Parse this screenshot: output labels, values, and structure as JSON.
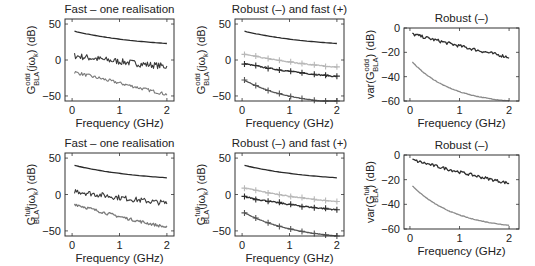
{
  "chart_data": [
    {
      "id": "p1",
      "type": "line",
      "title": "Fast – one realisation",
      "xlabel": "Frequency (GHz)",
      "ylabel_main": "G",
      "ylabel_sup": "odd",
      "ylabel_sub": "BLA",
      "ylabel_tail": "(jω",
      "ylabel_tail_sub": "k",
      "ylabel_end": ") (dB)",
      "xlim": [
        -0.15,
        2.15
      ],
      "ylim": [
        -57,
        57
      ],
      "xticks": [
        0,
        1,
        2
      ],
      "yticks": [
        50,
        0,
        -50
      ],
      "box": [
        65,
        19,
        174,
        101
      ],
      "series": [
        {
          "name": "BLA",
          "color": "#2a2a2a",
          "start": 40,
          "end": 23,
          "curve": 0.6,
          "noise": 0,
          "markers": false
        },
        {
          "name": "Total distortion",
          "color": "#3a3a3a",
          "start": 6,
          "end": -9,
          "curve": 0.2,
          "noise": 4.5,
          "markers": false
        },
        {
          "name": "Noise",
          "color": "#7a7a7a",
          "start": -17,
          "end": -48,
          "curve": 0,
          "noise": 2.2,
          "markers": false
        }
      ]
    },
    {
      "id": "p2",
      "type": "line",
      "title": "Robust (–) and fast (+)",
      "xlabel": "Frequency (GHz)",
      "ylabel_main": "G",
      "ylabel_sup": "odd",
      "ylabel_sub": "BLA",
      "ylabel_tail": "(jω",
      "ylabel_tail_sub": "k",
      "ylabel_end": ") (dB)",
      "xlim": [
        -0.15,
        2.15
      ],
      "ylim": [
        -57,
        57
      ],
      "xticks": [
        0,
        1,
        2
      ],
      "yticks": [
        50,
        0,
        -50
      ],
      "box": [
        235,
        19,
        344,
        101
      ],
      "series": [
        {
          "name": "BLA",
          "color": "#2a2a2a",
          "start": 40,
          "end": 23,
          "curve": 0.6,
          "noise": 0,
          "markers": false
        },
        {
          "name": "Total distortion (robust)",
          "color": "#b8b8b8",
          "start": 8,
          "end": -10,
          "curve": 0.4,
          "noise": 0.6,
          "markers": true
        },
        {
          "name": "Nonlinear distortion",
          "color": "#2e2e2e",
          "start": -5,
          "end": -23,
          "curve": 0.4,
          "noise": 0.8,
          "markers": true
        },
        {
          "name": "Noise",
          "color": "#555555",
          "start": -28,
          "end": -59,
          "curve": 0.9,
          "noise": 0.3,
          "markers": true
        }
      ]
    },
    {
      "id": "p3",
      "type": "line",
      "title": "Robust (–)",
      "xlabel": "Frequency (GHz)",
      "ylabel_main": "var(G",
      "ylabel_sup": "odd",
      "ylabel_sub": "BLA",
      "ylabel_tail": ")",
      "ylabel_tail_sub": "",
      "ylabel_end": " (dB)",
      "xlim": [
        -0.12,
        2.2
      ],
      "ylim": [
        -60,
        0
      ],
      "xticks": [
        0,
        1,
        2
      ],
      "yticks": [
        0,
        -20,
        -40,
        -60
      ],
      "box": [
        404,
        28,
        519,
        101
      ],
      "series": [
        {
          "name": "Total variance",
          "color": "#2e2e2e",
          "start": -5,
          "end": -24,
          "curve": 0.1,
          "noise": 1.3,
          "markers": false
        },
        {
          "name": "Noise variance",
          "color": "#8a8a8a",
          "start": -28,
          "end": -60,
          "curve": 1.1,
          "noise": 0.2,
          "markers": false
        }
      ]
    },
    {
      "id": "p4",
      "type": "line",
      "title": "Fast – one realisation",
      "xlabel": "Frequency (GHz)",
      "ylabel_main": "G",
      "ylabel_sup": "full",
      "ylabel_sub": "BLA",
      "ylabel_tail": "(jω",
      "ylabel_tail_sub": "k",
      "ylabel_end": ") (dB)",
      "xlim": [
        -0.15,
        2.15
      ],
      "ylim": [
        -57,
        57
      ],
      "xticks": [
        0,
        1,
        2
      ],
      "yticks": [
        50,
        0,
        -50
      ],
      "box": [
        65,
        153,
        174,
        236
      ],
      "series": [
        {
          "name": "BLA",
          "color": "#2a2a2a",
          "start": 40,
          "end": 23,
          "curve": 0.6,
          "noise": 0,
          "markers": false
        },
        {
          "name": "Total distortion",
          "color": "#3a3a3a",
          "start": 5,
          "end": -12,
          "curve": 0.2,
          "noise": 3.8,
          "markers": false
        },
        {
          "name": "Noise",
          "color": "#7a7a7a",
          "start": -13,
          "end": -45,
          "curve": 0.2,
          "noise": 2.0,
          "markers": false
        }
      ]
    },
    {
      "id": "p5",
      "type": "line",
      "title": "Robust (–) and fast (+)",
      "xlabel": "Frequency (GHz)",
      "ylabel_main": "G",
      "ylabel_sup": "full",
      "ylabel_sub": "BLA",
      "ylabel_tail": "(jω",
      "ylabel_tail_sub": "k",
      "ylabel_end": ") (dB)",
      "xlim": [
        -0.15,
        2.15
      ],
      "ylim": [
        -57,
        57
      ],
      "xticks": [
        0,
        1,
        2
      ],
      "yticks": [
        50,
        0,
        -50
      ],
      "box": [
        235,
        153,
        344,
        236
      ],
      "series": [
        {
          "name": "BLA",
          "color": "#2a2a2a",
          "start": 40,
          "end": 23,
          "curve": 0.6,
          "noise": 0,
          "markers": false
        },
        {
          "name": "Total distortion (robust)",
          "color": "#b8b8b8",
          "start": 9,
          "end": -10,
          "curve": 0.4,
          "noise": 0.6,
          "markers": true
        },
        {
          "name": "Nonlinear distortion",
          "color": "#2e2e2e",
          "start": -3,
          "end": -21,
          "curve": 0.4,
          "noise": 0.9,
          "markers": true
        },
        {
          "name": "Noise",
          "color": "#555555",
          "start": -25,
          "end": -57,
          "curve": 0.8,
          "noise": 0.3,
          "markers": true
        }
      ]
    },
    {
      "id": "p6",
      "type": "line",
      "title": "Robust (–)",
      "xlabel": "Frequency (GHz)",
      "ylabel_main": "var(G",
      "ylabel_sup": "full",
      "ylabel_sub": "BLA",
      "ylabel_tail": ")",
      "ylabel_tail_sub": "",
      "ylabel_end": " (dB)",
      "xlim": [
        -0.12,
        2.2
      ],
      "ylim": [
        -60,
        0
      ],
      "xticks": [
        0,
        1,
        2
      ],
      "yticks": [
        0,
        -20,
        -40,
        -60
      ],
      "box": [
        404,
        155,
        519,
        229
      ],
      "series": [
        {
          "name": "Total variance",
          "color": "#2e2e2e",
          "start": -4,
          "end": -23,
          "curve": 0.1,
          "noise": 1.2,
          "markers": false
        },
        {
          "name": "Noise variance",
          "color": "#8a8a8a",
          "start": -25,
          "end": -57,
          "curve": 1.0,
          "noise": 0.2,
          "markers": false
        }
      ]
    }
  ]
}
